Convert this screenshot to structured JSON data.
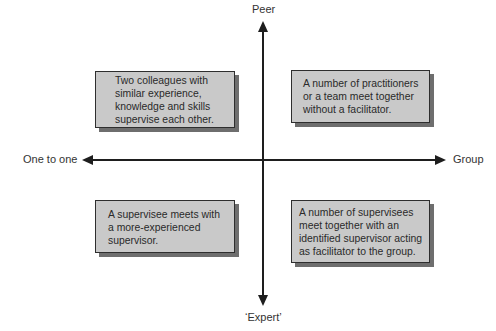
{
  "diagram": {
    "type": "quadrant",
    "axes": {
      "top": "Peer",
      "bottom": "‘Expert’",
      "left": "One to one",
      "right": "Group"
    },
    "quadrants": {
      "top_left": "Two colleagues with\nsimilar experience,\nknowledge and skills\nsupervise each other.",
      "top_right": "A number of practitioners\nor a team meet together\nwithout a facilitator.",
      "bottom_left": "A supervisee meets with\na more-experienced\nsupervisor.",
      "bottom_right": "A number of supervisees\nmeet together with an\nidentified supervisor acting\nas facilitator to the group."
    },
    "colors": {
      "box_fill": "#c9c9c9",
      "box_border": "#2e2e2e",
      "box_shadow": "#6e6e6e",
      "axis": "#1e1e1e"
    }
  }
}
